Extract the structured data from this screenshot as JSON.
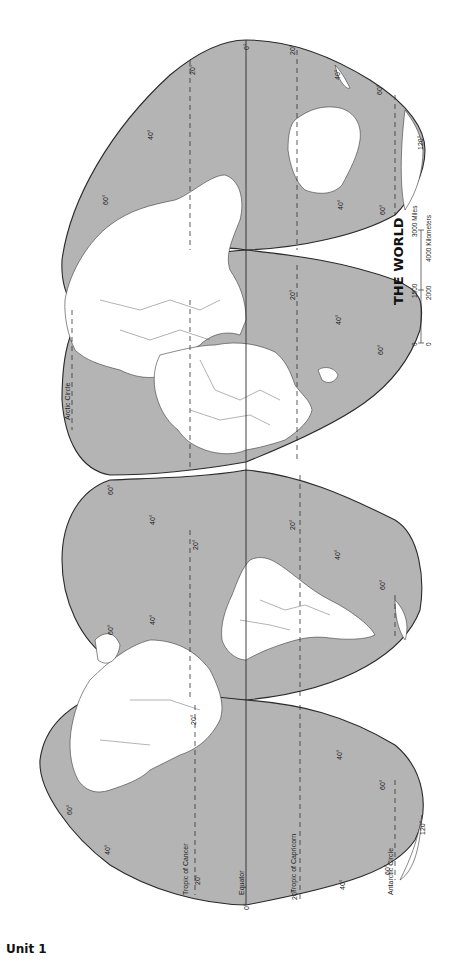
{
  "page": {
    "footer_label": "Unit 1"
  },
  "map": {
    "title": "THE WORLD",
    "orientation": "rotated 90° clockwise; north at left, equator vertical",
    "colors": {
      "ocean": "#b4b4b4",
      "land": "#ffffff",
      "outline": "#2a2a2a"
    },
    "lines": {
      "equator": "Equator",
      "tropic_cancer": "Tropic of Cancer",
      "tropic_capricorn": "Tropic of Capricorn",
      "arctic_circle": "Arctic Circle",
      "antarctic_circle": "Antarctic Circle"
    },
    "scale": {
      "miles_labels": [
        "0",
        "1500",
        "3000 Miles"
      ],
      "km_labels": [
        "0",
        "2000",
        "4000 Kilometers"
      ]
    },
    "degree_labels": {
      "equator": "0°",
      "d20": "20°",
      "d40": "40°",
      "d60": "60°",
      "d120": "120°"
    }
  }
}
